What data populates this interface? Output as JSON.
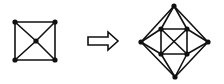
{
  "diagram": {
    "colors": {
      "background": "#ffffff",
      "stroke": "#111111",
      "node": "#111111",
      "arrow_fill": "#ffffff"
    },
    "stroke_width": 1.6,
    "node_radius": 2.6,
    "left_graph": {
      "name": "square-with-center",
      "nodes": [
        {
          "id": "a",
          "x": 15,
          "y": 22
        },
        {
          "id": "b",
          "x": 55,
          "y": 22
        },
        {
          "id": "c",
          "x": 55,
          "y": 60
        },
        {
          "id": "d",
          "x": 15,
          "y": 60
        },
        {
          "id": "e",
          "x": 36,
          "y": 41
        }
      ],
      "edges": [
        [
          "a",
          "b"
        ],
        [
          "b",
          "c"
        ],
        [
          "c",
          "d"
        ],
        [
          "d",
          "a"
        ],
        [
          "a",
          "e"
        ],
        [
          "b",
          "e"
        ],
        [
          "c",
          "e"
        ],
        [
          "d",
          "e"
        ]
      ]
    },
    "arrow": {
      "name": "transformation-arrow",
      "points": "88,37 108,37 108,32 118,41 108,50 108,45 88,45"
    },
    "right_graph": {
      "name": "octahedral-graph",
      "nodes": [
        {
          "id": "top",
          "x": 174,
          "y": 6
        },
        {
          "id": "left",
          "x": 141,
          "y": 42
        },
        {
          "id": "right",
          "x": 208,
          "y": 42
        },
        {
          "id": "bottom",
          "x": 175,
          "y": 77
        },
        {
          "id": "tl",
          "x": 161,
          "y": 29
        },
        {
          "id": "tr",
          "x": 187,
          "y": 29
        },
        {
          "id": "bl",
          "x": 161,
          "y": 54
        },
        {
          "id": "br",
          "x": 187,
          "y": 54
        }
      ],
      "edges": [
        [
          "top",
          "left"
        ],
        [
          "top",
          "right"
        ],
        [
          "top",
          "tl"
        ],
        [
          "top",
          "tr"
        ],
        [
          "bottom",
          "left"
        ],
        [
          "bottom",
          "right"
        ],
        [
          "bottom",
          "bl"
        ],
        [
          "bottom",
          "br"
        ],
        [
          "left",
          "tl"
        ],
        [
          "left",
          "bl"
        ],
        [
          "right",
          "tr"
        ],
        [
          "right",
          "br"
        ],
        [
          "tl",
          "tr"
        ],
        [
          "tr",
          "br"
        ],
        [
          "br",
          "bl"
        ],
        [
          "bl",
          "tl"
        ],
        [
          "tl",
          "br"
        ],
        [
          "tr",
          "bl"
        ]
      ]
    }
  }
}
